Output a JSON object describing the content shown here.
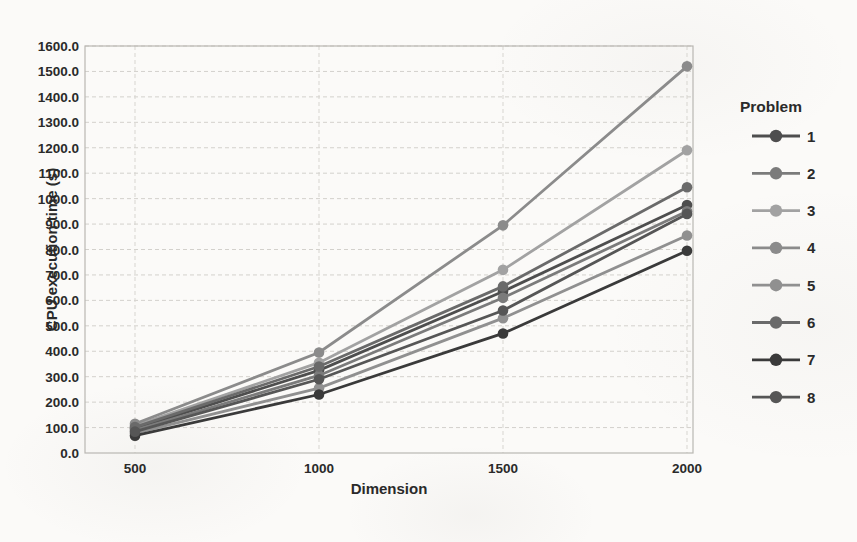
{
  "chart_data": {
    "type": "line",
    "title": "",
    "xlabel": "Dimension",
    "ylabel": "CPU execution time (s)",
    "legend_title": "Problem",
    "legend_position": "right",
    "grid": true,
    "x": [
      500,
      1000,
      1500,
      2000
    ],
    "x_tick_labels": [
      "500",
      "1000",
      "1500",
      "2000"
    ],
    "y_tick_labels": [
      "0.0",
      "100.0",
      "200.0",
      "300.0",
      "400.0",
      "500.0",
      "600.0",
      "700.0",
      "800.0",
      "900.0",
      "1000.0",
      "1100.0",
      "1200.0",
      "1300.0",
      "1400.0",
      "1500.0",
      "1600.0"
    ],
    "ylim": [
      0,
      1600
    ],
    "y_tick_step": 100,
    "series": [
      {
        "name": "1",
        "color": "#4e4e4e",
        "values": [
          96,
          325,
          635,
          975
        ]
      },
      {
        "name": "2",
        "color": "#7b7b7b",
        "values": [
          90,
          305,
          610,
          950
        ]
      },
      {
        "name": "3",
        "color": "#a2a2a2",
        "values": [
          108,
          355,
          720,
          1190
        ]
      },
      {
        "name": "4",
        "color": "#8b8b8b",
        "values": [
          115,
          395,
          895,
          1520
        ]
      },
      {
        "name": "5",
        "color": "#909090",
        "values": [
          78,
          255,
          530,
          855
        ]
      },
      {
        "name": "6",
        "color": "#6a6a6a",
        "values": [
          102,
          340,
          655,
          1045
        ]
      },
      {
        "name": "7",
        "color": "#3a3a3a",
        "values": [
          68,
          230,
          470,
          795
        ]
      },
      {
        "name": "8",
        "color": "#565656",
        "values": [
          84,
          290,
          560,
          940
        ]
      }
    ]
  }
}
